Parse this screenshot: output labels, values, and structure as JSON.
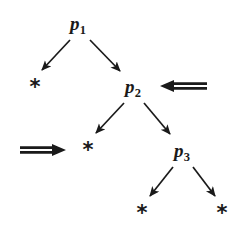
{
  "diagram": {
    "type": "binary-tree",
    "background_color": "#ffffff",
    "ink_color": "#1a1a1a",
    "width": 232,
    "height": 228,
    "nodes": [
      {
        "id": "p1",
        "label": "p",
        "subscript": "1",
        "text": "p1",
        "x": 78,
        "y": 25,
        "level": 0,
        "kind": "internal"
      },
      {
        "id": "leaf_a",
        "label": "*",
        "text": "*",
        "x": 35,
        "y": 87,
        "level": 1,
        "kind": "leaf"
      },
      {
        "id": "p2",
        "label": "p",
        "subscript": "2",
        "text": "p2",
        "x": 133,
        "y": 88,
        "level": 1,
        "kind": "internal"
      },
      {
        "id": "leaf_b",
        "label": "*",
        "text": "*",
        "x": 88,
        "y": 150,
        "level": 2,
        "kind": "leaf"
      },
      {
        "id": "p3",
        "label": "p",
        "subscript": "3",
        "text": "p3",
        "x": 182,
        "y": 152,
        "level": 2,
        "kind": "internal"
      },
      {
        "id": "leaf_c",
        "label": "*",
        "text": "*",
        "x": 142,
        "y": 213,
        "level": 3,
        "kind": "leaf"
      },
      {
        "id": "leaf_d",
        "label": "*",
        "text": "*",
        "x": 222,
        "y": 213,
        "level": 3,
        "kind": "leaf"
      }
    ],
    "edges": [
      {
        "id": "edge-p1-leaf-a",
        "from": "p1",
        "to": "leaf_a",
        "x1": 70,
        "y1": 40,
        "x2": 42,
        "y2": 70,
        "style": "single-arrow"
      },
      {
        "id": "edge-p1-p2",
        "from": "p1",
        "to": "p2",
        "x1": 90,
        "y1": 40,
        "x2": 120,
        "y2": 71,
        "style": "single-arrow"
      },
      {
        "id": "edge-p2-leaf-b",
        "from": "p2",
        "to": "leaf_b",
        "x1": 124,
        "y1": 103,
        "x2": 96,
        "y2": 133,
        "style": "single-arrow"
      },
      {
        "id": "edge-p2-p3",
        "from": "p2",
        "to": "p3",
        "x1": 144,
        "y1": 103,
        "x2": 170,
        "y2": 134,
        "style": "single-arrow"
      },
      {
        "id": "edge-p3-leaf-c",
        "from": "p3",
        "to": "leaf_c",
        "x1": 173,
        "y1": 167,
        "x2": 150,
        "y2": 196,
        "style": "single-arrow"
      },
      {
        "id": "edge-p3-leaf-d",
        "from": "p3",
        "to": "leaf_d",
        "x1": 193,
        "y1": 167,
        "x2": 215,
        "y2": 196,
        "style": "single-arrow"
      }
    ],
    "annotations": [
      {
        "id": "pointer-to-p2",
        "glyph": "⟸",
        "direction": "left",
        "points_at": "p2",
        "x1": 207,
        "y1": 86,
        "x2": 160,
        "y2": 86
      },
      {
        "id": "pointer-to-leaf-b",
        "glyph": "⟹",
        "direction": "right",
        "points_at": "leaf_b",
        "x1": 20,
        "y1": 150,
        "x2": 66,
        "y2": 150
      }
    ]
  }
}
